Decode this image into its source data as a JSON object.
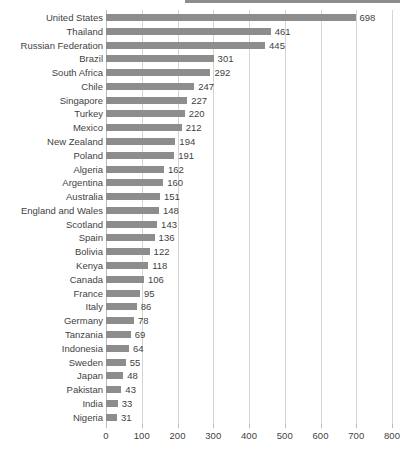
{
  "chart_data": {
    "type": "bar",
    "orientation": "horizontal",
    "title": "",
    "subtitle": "",
    "xlabel": "",
    "ylabel": "",
    "xlim": [
      0,
      800
    ],
    "xticks": [
      0,
      100,
      200,
      300,
      400,
      500,
      600,
      700,
      800
    ],
    "grid": true,
    "legend": null,
    "bar_color": "#8d8d8d",
    "gridline_color": "#d4d4d4",
    "axis_color": "#bcbcbc",
    "text_color": "#3f3f3f",
    "show_value_labels": true,
    "categories": [
      "United States",
      "Thailand",
      "Russian Federation",
      "Brazil",
      "South Africa",
      "Chile",
      "Singapore",
      "Turkey",
      "Mexico",
      "New Zealand",
      "Poland",
      "Algeria",
      "Argentina",
      "Australia",
      "England and Wales",
      "Scotland",
      "Spain",
      "Bolivia",
      "Kenya",
      "Canada",
      "France",
      "Italy",
      "Germany",
      "Tanzania",
      "Indonesia",
      "Sweden",
      "Japan",
      "Pakistan",
      "India",
      "Nigeria"
    ],
    "values": [
      698,
      461,
      445,
      301,
      292,
      247,
      227,
      220,
      212,
      194,
      191,
      162,
      160,
      151,
      148,
      143,
      136,
      122,
      118,
      106,
      95,
      86,
      78,
      69,
      64,
      55,
      48,
      43,
      33,
      31
    ]
  }
}
